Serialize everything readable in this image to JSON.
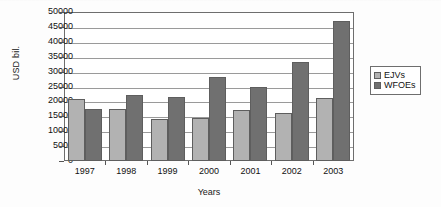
{
  "chart_data": {
    "type": "bar",
    "title": "",
    "xlabel": "Years",
    "ylabel": "USD bil.",
    "categories": [
      "1997",
      "1998",
      "1999",
      "2000",
      "2001",
      "2002",
      "2003"
    ],
    "series": [
      {
        "name": "EJVs",
        "color": "#b2b2b2",
        "values": [
          20700,
          17400,
          14200,
          14300,
          17200,
          16100,
          21100
        ]
      },
      {
        "name": "WFOEs",
        "color": "#707070",
        "values": [
          17500,
          22200,
          21500,
          28200,
          24900,
          33100,
          47000
        ]
      }
    ],
    "ylim": [
      0,
      50000
    ],
    "ytick_step": 5000,
    "yticks": [
      "50000",
      "45000",
      "40000",
      "35000",
      "30000",
      "25000",
      "20000",
      "15000",
      "10000",
      "5000",
      "0"
    ],
    "grid": true,
    "legend_position": "right"
  },
  "legend": {
    "items": [
      {
        "label": "EJVs",
        "swatch": "ejv"
      },
      {
        "label": "WFOEs",
        "swatch": "wfoe"
      }
    ]
  }
}
